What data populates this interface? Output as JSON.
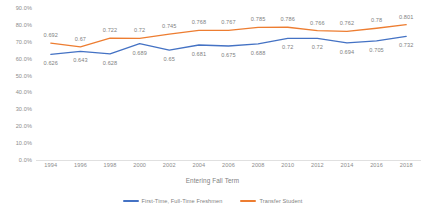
{
  "chart_data": {
    "type": "line",
    "title": "",
    "xlabel": "Entering Fall Term",
    "ylabel": "",
    "categories": [
      "1994",
      "1996",
      "1998",
      "2000",
      "2002",
      "2004",
      "2006",
      "2008",
      "2010",
      "2012",
      "2014",
      "2016",
      "2018"
    ],
    "ylim": [
      0,
      0.9
    ],
    "y_ticks": [
      "0.0%",
      "10.0%",
      "20.0%",
      "30.0%",
      "40.0%",
      "50.0%",
      "60.0%",
      "70.0%",
      "80.0%",
      "90.0%"
    ],
    "y_tick_values": [
      0,
      0.1,
      0.2,
      0.3,
      0.4,
      0.5,
      0.6,
      0.7,
      0.8,
      0.9
    ],
    "grid": false,
    "legend_position": "bottom",
    "series": [
      {
        "name": "First-Time, Full-Time Freshmen",
        "color": "#4472C4",
        "values": [
          0.626,
          0.643,
          0.628,
          0.689,
          0.65,
          0.681,
          0.675,
          0.688,
          0.72,
          0.72,
          0.694,
          0.705,
          0.732
        ],
        "labels": [
          "0.626",
          "0.643",
          "0.628",
          "0.689",
          "0.65",
          "0.681",
          "0.675",
          "0.688",
          "0.72",
          "0.72",
          "0.694",
          "0.705",
          "0.732"
        ],
        "label_side": [
          "below",
          "below",
          "below",
          "below",
          "below",
          "below",
          "below",
          "below",
          "below",
          "below",
          "below",
          "below",
          "below"
        ]
      },
      {
        "name": "Transfer Student",
        "color": "#ED7D31",
        "values": [
          0.692,
          0.67,
          0.722,
          0.72,
          0.745,
          0.768,
          0.767,
          0.785,
          0.786,
          0.766,
          0.762,
          0.78,
          0.801
        ],
        "labels": [
          "0.692",
          "0.67",
          "0.722",
          "0.72",
          "0.745",
          "0.768",
          "0.767",
          "0.785",
          "0.786",
          "0.766",
          "0.762",
          "0.78",
          "0.801"
        ],
        "label_side": [
          "above",
          "above",
          "above",
          "above",
          "above",
          "above",
          "above",
          "above",
          "above",
          "above",
          "above",
          "above",
          "above"
        ]
      }
    ]
  },
  "colors": {
    "series_1": "#4472C4",
    "series_2": "#ED7D31",
    "axis_text": "#8c8c8c",
    "label_text": "#7f7f7f",
    "baseline": "#e0e0e0",
    "background": "#ffffff"
  }
}
